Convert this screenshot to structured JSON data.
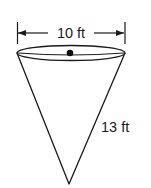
{
  "diagram": {
    "shape": "cone",
    "orientation": "inverted",
    "diameter_label": "10 ft",
    "slant_height_label": "13 ft",
    "colors": {
      "stroke": "#1a1a1a",
      "fill": "#ffffff"
    }
  }
}
